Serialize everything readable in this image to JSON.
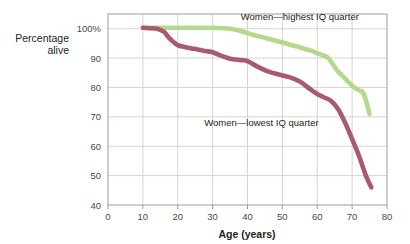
{
  "chart_data": {
    "type": "line",
    "title": "",
    "xlabel": "Age (years)",
    "ylabel": "Percentage alive",
    "xlim": [
      0,
      80
    ],
    "ylim": [
      40,
      105
    ],
    "xticks": [
      0,
      10,
      20,
      30,
      40,
      50,
      60,
      70,
      80
    ],
    "xtick_labels": [
      "0",
      "10",
      "20",
      "30",
      "40",
      "50",
      "60",
      "70",
      "80"
    ],
    "yticks": [
      40,
      50,
      60,
      70,
      80,
      90,
      100
    ],
    "ytick_labels": [
      "40",
      "50",
      "60",
      "70",
      "80",
      "90",
      "100%"
    ],
    "grid": true,
    "legend_position": "inline-annotations",
    "series": [
      {
        "name": "Women—highest IQ quarter",
        "color": "#b5d98c",
        "label_x": 55,
        "label_y": 103,
        "x": [
          10,
          15,
          20,
          25,
          30,
          35,
          38,
          42,
          46,
          50,
          54,
          58,
          61,
          63,
          65,
          66,
          68,
          70,
          72,
          73,
          74,
          75
        ],
        "y": [
          100.3,
          100.3,
          100.3,
          100.3,
          100.3,
          100.0,
          99.2,
          97.8,
          96.6,
          95.3,
          94.0,
          92.6,
          91.2,
          90.2,
          87.0,
          85.4,
          83.0,
          80.6,
          79.0,
          78.4,
          75.5,
          71.0
        ]
      },
      {
        "name": "Women—lowest IQ quarter",
        "color": "#a85a70",
        "label_x": 44,
        "label_y": 67,
        "x": [
          10,
          14,
          16,
          17,
          18,
          20,
          22,
          24,
          26,
          28,
          30,
          32,
          35,
          38,
          40,
          43,
          46,
          49,
          52,
          55,
          58,
          60,
          62,
          64,
          66,
          68,
          70,
          72,
          74,
          75.5
        ],
        "y": [
          100.3,
          100.0,
          99.0,
          97.6,
          96.3,
          94.4,
          93.8,
          93.3,
          92.8,
          92.4,
          92.0,
          91.0,
          89.8,
          89.3,
          89.0,
          87.0,
          85.4,
          84.4,
          83.5,
          82.0,
          79.4,
          77.8,
          76.6,
          75.4,
          72.6,
          68.0,
          62.4,
          56.6,
          49.8,
          46.0
        ]
      }
    ]
  },
  "plot": {
    "left": 108,
    "right": 387,
    "top": 14,
    "bottom": 205
  }
}
